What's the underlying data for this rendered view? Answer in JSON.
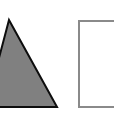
{
  "canvas": {
    "width": 114,
    "height": 116,
    "background_color": "#ffffff"
  },
  "figure": {
    "shape_count": 2
  },
  "shapes": [
    {
      "name": "triangle",
      "kind": "triangle",
      "label": "Gray filled triangle",
      "fill_color": "#808080",
      "stroke_color": "#0d0d0d",
      "stroke_width": 2,
      "clipped_at_left_edge": true,
      "points": "9,20 57,107 -14,107",
      "apex": {
        "x": 9,
        "y": 20
      },
      "bottom_right": {
        "x": 57,
        "y": 107
      },
      "baseline_y": 107
    },
    {
      "name": "rectangle",
      "kind": "rectangle",
      "label": "Open outlined rectangle",
      "fill_color": "#ffffff",
      "stroke_color": "#8a8a8a",
      "stroke_width": 2,
      "clipped_at_right_edge": true,
      "x": 79,
      "y": 21,
      "width": 42,
      "height": 86
    }
  ]
}
